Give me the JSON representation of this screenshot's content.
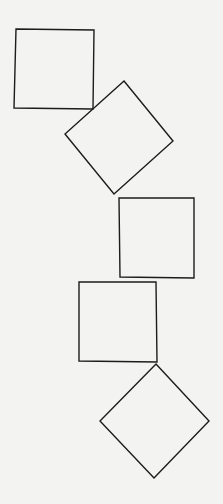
{
  "figure": {
    "width": 223,
    "height": 504,
    "background_color": "#f3f3f2",
    "stroke_color": "#1c1c1c",
    "stroke_width": 1.4
  },
  "shapes": [
    {
      "id": "square-1",
      "kind": "square",
      "orientation": "axis-aligned",
      "points": [
        [
          16,
          29
        ],
        [
          94,
          30
        ],
        [
          93,
          109
        ],
        [
          14,
          108
        ]
      ]
    },
    {
      "id": "square-2",
      "kind": "square",
      "orientation": "rotated",
      "points": [
        [
          124,
          81
        ],
        [
          173,
          141
        ],
        [
          114,
          194
        ],
        [
          65,
          134
        ]
      ]
    },
    {
      "id": "square-3",
      "kind": "square",
      "orientation": "axis-aligned",
      "points": [
        [
          119,
          198
        ],
        [
          194,
          198
        ],
        [
          194,
          278
        ],
        [
          120,
          277
        ]
      ]
    },
    {
      "id": "square-4",
      "kind": "square",
      "orientation": "axis-aligned",
      "points": [
        [
          79,
          282
        ],
        [
          156,
          282
        ],
        [
          157,
          362
        ],
        [
          79,
          361
        ]
      ]
    },
    {
      "id": "square-5",
      "kind": "diamond",
      "orientation": "rotated-45",
      "points": [
        [
          156,
          364
        ],
        [
          209,
          421
        ],
        [
          154,
          478
        ],
        [
          100,
          421
        ]
      ]
    }
  ]
}
